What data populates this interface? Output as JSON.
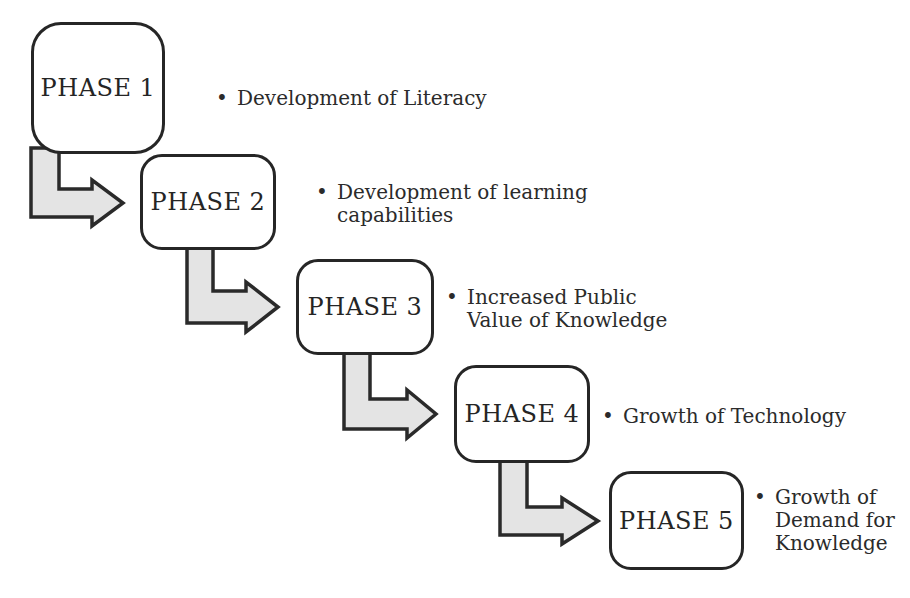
{
  "diagram": {
    "type": "stepped-process-flow",
    "bullet_glyph": "•",
    "phases": [
      {
        "label": "PHASE 1",
        "bullet_lines": [
          "Development of Literacy"
        ]
      },
      {
        "label": "PHASE 2",
        "bullet_lines": [
          "Development of learning",
          "capabilities"
        ]
      },
      {
        "label": "PHASE 3",
        "bullet_lines": [
          "Increased Public",
          "Value of Knowledge"
        ]
      },
      {
        "label": "PHASE 4",
        "bullet_lines": [
          "Growth of Technology"
        ]
      },
      {
        "label": "PHASE 5",
        "bullet_lines": [
          "Growth of",
          "Demand for",
          "Knowledge"
        ]
      }
    ],
    "colors": {
      "background": "#ffffff",
      "box_fill": "#ffffff",
      "outline": "#2a2a2a",
      "arrow_fill": "#e4e4e4",
      "text": "#2b2b2b"
    }
  }
}
